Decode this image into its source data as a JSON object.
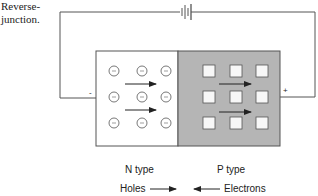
{
  "caption": {
    "line1": "Reverse-",
    "line2": "junction."
  },
  "circuit": {
    "negative_terminal": "-",
    "positive_terminal": "+"
  },
  "regions": {
    "n": {
      "label": "N type",
      "fill": "#ffffff",
      "carrier_symbol": "-",
      "grid": [
        3,
        3
      ]
    },
    "p": {
      "label": "P type",
      "fill": "#b5b5b5",
      "grid": [
        3,
        3
      ]
    }
  },
  "legend": {
    "holes": "Holes",
    "electrons": "Electrons"
  },
  "colors": {
    "line": "#555555",
    "p_fill": "#b5b5b5",
    "square_fill": "#f7f7f7"
  }
}
